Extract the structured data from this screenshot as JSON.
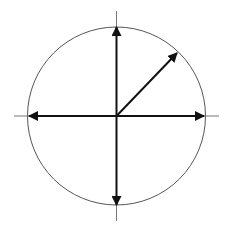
{
  "diagram": {
    "type": "unit-circle-vectors",
    "center": [
      116.5,
      116
    ],
    "radius": 89,
    "colors": {
      "circle": "#555555",
      "axis": "#777777",
      "arrow": "#111111",
      "background": "#ffffff"
    },
    "axes": {
      "horizontal": {
        "x1": 14,
        "x2": 219,
        "y": 116
      },
      "vertical": {
        "y1": 11,
        "y2": 221,
        "x": 116.5
      }
    },
    "vectors": [
      {
        "name": "up",
        "angle_deg": 90,
        "end": [
          116.5,
          27
        ]
      },
      {
        "name": "down",
        "angle_deg": 270,
        "end": [
          116.5,
          205
        ]
      },
      {
        "name": "left",
        "angle_deg": 180,
        "end": [
          29,
          116
        ]
      },
      {
        "name": "right",
        "angle_deg": 0,
        "end": [
          204,
          116
        ]
      },
      {
        "name": "diagonal",
        "angle_deg": 45,
        "end": [
          177,
          53
        ]
      }
    ]
  }
}
